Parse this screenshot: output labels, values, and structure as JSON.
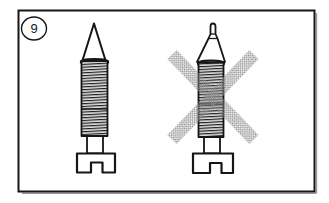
{
  "figure": {
    "number": "9"
  },
  "icons": {
    "badge": "circled-figure-number",
    "left": "needle-screw-sharp-tip-icon",
    "right": "needle-screw-damaged-tip-icon",
    "overlay": "prohibition-cross-icon"
  },
  "colors": {
    "background": "#ffffff",
    "line": "#161616",
    "thread_ink": "#1d1d1d",
    "cross": "#8f8f8f",
    "shadow": "#9a9a9a"
  }
}
